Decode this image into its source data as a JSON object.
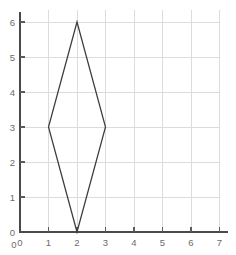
{
  "chart_data": {
    "type": "scatter",
    "title": "",
    "subtitle": "",
    "xlabel": "",
    "ylabel": "",
    "xlim": [
      0,
      7
    ],
    "ylim": [
      0,
      6
    ],
    "grid": true,
    "legend": null,
    "x_ticks": [
      "0",
      "1",
      "2",
      "3",
      "4",
      "5",
      "6",
      "7"
    ],
    "y_ticks": [
      "0",
      "1",
      "2",
      "3",
      "4",
      "5",
      "6"
    ],
    "x_tick_values": [
      0,
      1,
      2,
      3,
      4,
      5,
      6,
      7
    ],
    "y_tick_values": [
      0,
      1,
      2,
      3,
      4,
      5,
      6
    ],
    "origin_label": "0",
    "series": [
      {
        "name": "rhombus",
        "shape": "polygon",
        "closed": true,
        "points": [
          {
            "x": 2,
            "y": 6
          },
          {
            "x": 3,
            "y": 3
          },
          {
            "x": 2,
            "y": 0
          },
          {
            "x": 1,
            "y": 3
          }
        ],
        "vertex_labels": [
          "(2, 6)",
          "(3, 3)",
          "(2, 0)",
          "(1, 3)"
        ]
      }
    ],
    "annotations": []
  },
  "style": {
    "background": "#ffffff",
    "grid_color": "#dcdcdc",
    "axis_color": "#4a4a4a",
    "tick_color": "#5a5a5a",
    "label_color": "#6b6b6b",
    "shape_stroke": "#3c3c3c"
  },
  "geometry": {
    "origin_px": {
      "x": 20,
      "y": 232
    },
    "unit_px": {
      "x": 28.5,
      "y": 35.0
    },
    "grid_top_px": 22,
    "grid_right_px": 219,
    "y_axis_top_px": 12,
    "x_axis_right_px": 228
  }
}
